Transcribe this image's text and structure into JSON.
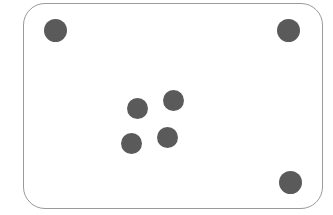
{
  "canvas": {
    "width": 333,
    "height": 215,
    "background_color": "#ffffff"
  },
  "panel": {
    "label": "rounded-rectangle-panel",
    "x": 23,
    "y": 3,
    "width": 300,
    "height": 206,
    "corner_radius": 22,
    "fill_color": "#ffffff",
    "border_color": "#9a9a9a",
    "border_width": 1.2
  },
  "dots": {
    "fill_color": "#5a5a5a",
    "count": 7,
    "groups": [
      {
        "name": "corner-markers",
        "count": 3,
        "items": [
          {
            "name": "dot-top-left",
            "cx": 55,
            "cy": 30,
            "r": 11.5
          },
          {
            "name": "dot-top-right",
            "cx": 288,
            "cy": 30,
            "r": 11.5
          },
          {
            "name": "dot-bottom-right",
            "cx": 290,
            "cy": 182,
            "r": 11.5
          }
        ]
      },
      {
        "name": "center-cluster",
        "count": 4,
        "items": [
          {
            "name": "dot-cluster-upper-left",
            "cx": 137,
            "cy": 108,
            "r": 10.5
          },
          {
            "name": "dot-cluster-upper-right",
            "cx": 173,
            "cy": 100,
            "r": 10.5
          },
          {
            "name": "dot-cluster-lower-left",
            "cx": 131,
            "cy": 143,
            "r": 10.5
          },
          {
            "name": "dot-cluster-lower-right",
            "cx": 167,
            "cy": 137,
            "r": 10.5
          }
        ]
      }
    ]
  }
}
